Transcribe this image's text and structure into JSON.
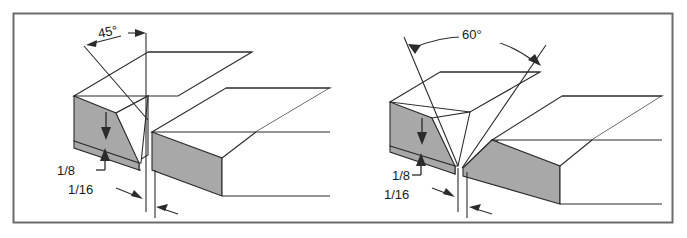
{
  "figure": {
    "frame": {
      "border_color": "#6b6b6b",
      "background_color": "#ffffff"
    },
    "style": {
      "line_color": "#2b2b2b",
      "shaded_face_color": "#a8a8a8",
      "shaded_face_edge_color": "#2b2b2b",
      "text_color": "#1a1a1a"
    }
  },
  "diagrams": [
    {
      "id": "left",
      "name": "single-bevel-groove-joint",
      "angle_label": "45°",
      "root_face_label": "1/8",
      "root_opening_label": "1/16",
      "beveled_members": 1
    },
    {
      "id": "right",
      "name": "double-bevel-groove-joint",
      "angle_label": "60°",
      "root_face_label": "1/8",
      "root_opening_label": "1/16",
      "beveled_members": 2
    }
  ]
}
